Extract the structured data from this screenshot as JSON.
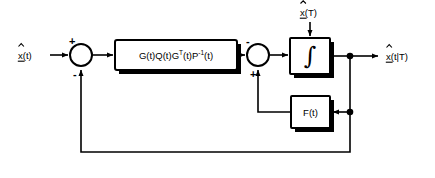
{
  "diagram": {
    "type": "control-block-diagram",
    "background_color": "#ffffff",
    "line_color": "#000000",
    "canvas": {
      "width": 435,
      "height": 178
    },
    "signals": {
      "input_left": {
        "symbol": "x",
        "accent": "hat",
        "underline": true,
        "argument": "(t)",
        "text": "x(t)"
      },
      "input_top": {
        "symbol": "x",
        "accent": "hat",
        "underline": true,
        "argument": "(T)",
        "text": "x(T)"
      },
      "output_right": {
        "symbol": "x",
        "accent": "hat",
        "underline": true,
        "argument": "(t|T)",
        "text": "x(t|T)"
      }
    },
    "blocks": [
      {
        "id": "gain-block",
        "name": "gain-matrix-block",
        "label_parts": [
          {
            "text": "G(t)Q(t)G",
            "sup": ""
          },
          {
            "text": "",
            "sup": "T"
          },
          {
            "text": "(t)P",
            "sup": ""
          },
          {
            "text": "",
            "sup": "-1"
          },
          {
            "text": "(t)",
            "sup": ""
          }
        ],
        "label_plain": "G(t)Q(t)G^T(t)P^-1(t)",
        "x": 115,
        "y": 40,
        "width": 122,
        "height": 30
      },
      {
        "id": "integrator-block",
        "name": "integrator-block",
        "label_plain": "∫",
        "x": 290,
        "y": 38,
        "width": 40,
        "height": 36
      },
      {
        "id": "feedback-block",
        "name": "feedback-matrix-block",
        "label_plain": "F(t)",
        "x": 291,
        "y": 96,
        "width": 39,
        "height": 32
      }
    ],
    "summing_junctions": [
      {
        "id": "sum-1",
        "name": "summing-junction-left",
        "cx": 81,
        "cy": 55,
        "r": 11,
        "signs": [
          {
            "label": "+",
            "position": "top-left"
          },
          {
            "label": "-",
            "position": "bottom"
          }
        ]
      },
      {
        "id": "sum-2",
        "name": "summing-junction-right",
        "cx": 258,
        "cy": 55,
        "r": 11,
        "signs": [
          {
            "label": "-",
            "position": "top-left"
          },
          {
            "label": "+",
            "position": "bottom"
          }
        ]
      }
    ],
    "junction_dots": [
      {
        "name": "output-tap-dot",
        "cx": 350,
        "cy": 56
      },
      {
        "name": "feedback-tap-dot",
        "cx": 350,
        "cy": 112
      }
    ]
  }
}
